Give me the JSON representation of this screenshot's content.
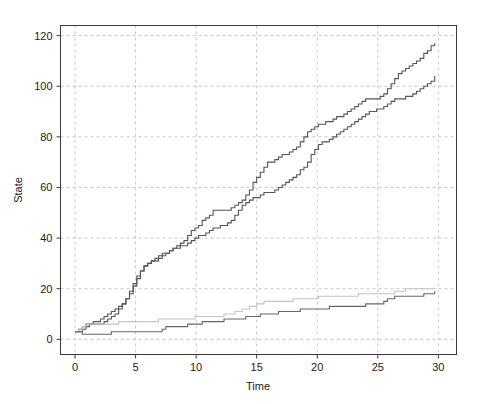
{
  "chart_data": {
    "type": "line",
    "title": "",
    "subtitle": "",
    "xlabel": "Time",
    "ylabel": "State",
    "xlim": [
      -1.2,
      31.5
    ],
    "ylim": [
      -6,
      124
    ],
    "xticks": [
      0,
      5,
      10,
      15,
      20,
      25,
      30
    ],
    "xticklabels": [
      "0",
      "5",
      "10",
      "15",
      "20",
      "25",
      "30"
    ],
    "yticks": [
      0,
      20,
      40,
      60,
      80,
      100,
      120
    ],
    "yticklabels": [
      "0",
      "20",
      "40",
      "60",
      "80",
      "100",
      "120"
    ],
    "grid": true,
    "grid_style": "dashed",
    "grid_color": "#b8b8b8",
    "legend": "none",
    "step_plot": true,
    "series": [
      {
        "name": "path-1-upper-fast",
        "color": "#555555",
        "linewidth": 1.1,
        "x": [
          0.0,
          0.3,
          0.6,
          0.9,
          1.2,
          1.5,
          1.8,
          2.1,
          2.4,
          2.7,
          3.0,
          3.3,
          3.6,
          3.9,
          4.2,
          4.5,
          4.8,
          5.1,
          5.4,
          5.7,
          6.0,
          6.3,
          6.6,
          6.9,
          7.2,
          7.5,
          7.8,
          8.1,
          8.4,
          8.7,
          9.0,
          9.3,
          9.6,
          9.9,
          10.2,
          10.5,
          10.8,
          11.1,
          11.4,
          11.7,
          12.0,
          12.3,
          12.6,
          12.9,
          13.2,
          13.5,
          13.8,
          14.1,
          14.4,
          14.7,
          15.0,
          15.3,
          15.6,
          15.9,
          16.2,
          16.5,
          16.8,
          17.1,
          17.4,
          17.7,
          18.0,
          18.3,
          18.6,
          18.9,
          19.2,
          19.5,
          19.8,
          20.1,
          20.4,
          20.7,
          21.0,
          21.3,
          21.6,
          21.9,
          22.2,
          22.5,
          22.8,
          23.1,
          23.4,
          23.7,
          24.0,
          24.3,
          24.6,
          24.9,
          25.2,
          25.5,
          25.8,
          26.1,
          26.4,
          26.7,
          27.0,
          27.3,
          27.6,
          27.9,
          28.2,
          28.5,
          28.8,
          29.1,
          29.4,
          29.7
        ],
        "y": [
          3,
          4,
          5,
          6,
          6,
          7,
          7,
          8,
          9,
          10,
          11,
          12,
          13,
          14,
          16,
          18,
          21,
          24,
          27,
          29,
          30,
          31,
          31,
          32,
          33,
          34,
          35,
          36,
          37,
          38,
          39,
          41,
          43,
          44,
          45,
          47,
          48,
          49,
          51,
          51,
          51,
          51,
          51,
          52,
          53,
          54,
          55,
          57,
          59,
          62,
          64,
          66,
          68,
          70,
          70,
          71,
          72,
          73,
          73,
          74,
          75,
          76,
          78,
          80,
          82,
          83,
          84,
          85,
          85,
          86,
          86,
          87,
          88,
          88,
          89,
          90,
          91,
          92,
          93,
          94,
          95,
          95,
          95,
          95,
          96,
          97,
          99,
          101,
          103,
          105,
          106,
          107,
          108,
          109,
          110,
          111,
          113,
          114,
          116,
          117
        ]
      },
      {
        "name": "path-2-upper-fast",
        "color": "#555555",
        "linewidth": 1.1,
        "x": [
          0.0,
          0.3,
          0.6,
          0.9,
          1.2,
          1.5,
          1.8,
          2.1,
          2.4,
          2.7,
          3.0,
          3.3,
          3.6,
          3.9,
          4.2,
          4.5,
          4.8,
          5.1,
          5.4,
          5.7,
          6.0,
          6.3,
          6.6,
          6.9,
          7.2,
          7.5,
          7.8,
          8.1,
          8.4,
          8.7,
          9.0,
          9.3,
          9.6,
          9.9,
          10.2,
          10.5,
          10.8,
          11.1,
          11.4,
          11.7,
          12.0,
          12.3,
          12.6,
          12.9,
          13.2,
          13.5,
          13.8,
          14.1,
          14.4,
          14.7,
          15.0,
          15.3,
          15.6,
          15.9,
          16.2,
          16.5,
          16.8,
          17.1,
          17.4,
          17.7,
          18.0,
          18.3,
          18.6,
          18.9,
          19.2,
          19.5,
          19.8,
          20.1,
          20.4,
          20.7,
          21.0,
          21.3,
          21.6,
          21.9,
          22.2,
          22.5,
          22.8,
          23.1,
          23.4,
          23.7,
          24.0,
          24.3,
          24.6,
          24.9,
          25.2,
          25.5,
          25.8,
          26.1,
          26.4,
          26.7,
          27.0,
          27.3,
          27.6,
          27.9,
          28.2,
          28.5,
          28.8,
          29.1,
          29.4,
          29.7
        ],
        "y": [
          3,
          3,
          4,
          5,
          6,
          6,
          6,
          6,
          7,
          8,
          9,
          10,
          12,
          14,
          16,
          19,
          22,
          25,
          27,
          29,
          30,
          31,
          32,
          33,
          34,
          34,
          35,
          36,
          36,
          37,
          37,
          38,
          39,
          40,
          41,
          41,
          42,
          43,
          44,
          44,
          45,
          45,
          46,
          47,
          49,
          51,
          53,
          54,
          55,
          56,
          56,
          57,
          58,
          58,
          58,
          59,
          60,
          61,
          62,
          63,
          64,
          65,
          67,
          68,
          70,
          73,
          75,
          77,
          78,
          78,
          79,
          80,
          81,
          82,
          83,
          84,
          85,
          86,
          87,
          88,
          89,
          90,
          90,
          91,
          91,
          92,
          93,
          94,
          95,
          95,
          95,
          96,
          96,
          97,
          98,
          99,
          100,
          101,
          102,
          104
        ]
      },
      {
        "name": "path-3-lower-light",
        "color": "#c4c4c4",
        "linewidth": 1.1,
        "x": [
          0.0,
          0.3,
          0.6,
          0.9,
          1.2,
          1.5,
          1.8,
          2.1,
          2.4,
          2.7,
          3.0,
          3.3,
          3.6,
          3.9,
          4.2,
          4.5,
          4.8,
          5.1,
          5.4,
          5.7,
          6.0,
          6.3,
          6.6,
          6.9,
          7.2,
          7.5,
          7.8,
          8.1,
          8.4,
          8.7,
          9.0,
          9.3,
          9.6,
          9.9,
          10.2,
          10.5,
          10.8,
          11.1,
          11.4,
          11.7,
          12.0,
          12.3,
          12.6,
          12.9,
          13.2,
          13.5,
          13.8,
          14.1,
          14.4,
          14.7,
          15.0,
          15.3,
          15.6,
          15.9,
          16.2,
          16.5,
          16.8,
          17.1,
          17.4,
          17.7,
          18.0,
          18.3,
          18.6,
          18.9,
          19.2,
          19.5,
          19.8,
          20.1,
          20.4,
          20.7,
          21.0,
          21.3,
          21.6,
          21.9,
          22.2,
          22.5,
          22.8,
          23.1,
          23.4,
          23.7,
          24.0,
          24.3,
          24.6,
          24.9,
          25.2,
          25.5,
          25.8,
          26.1,
          26.4,
          26.7,
          27.0,
          27.3,
          27.6,
          27.9,
          28.2,
          28.5,
          28.8,
          29.1,
          29.4,
          29.7
        ],
        "y": [
          3,
          4,
          5,
          6,
          6,
          6,
          6,
          6,
          6,
          6,
          6,
          6,
          7,
          7,
          7,
          7,
          7,
          7,
          7,
          7,
          7,
          7,
          7,
          8,
          8,
          8,
          8,
          8,
          8,
          8,
          8,
          8,
          8,
          9,
          9,
          9,
          9,
          9,
          9,
          9,
          9,
          10,
          10,
          10,
          11,
          11,
          12,
          12,
          13,
          13,
          14,
          14,
          15,
          15,
          15,
          15,
          15,
          15,
          15,
          15,
          16,
          16,
          16,
          16,
          16,
          16,
          16,
          17,
          17,
          17,
          17,
          17,
          17,
          17,
          17,
          17,
          17,
          17,
          18,
          18,
          18,
          18,
          18,
          18,
          18,
          18,
          18,
          18,
          19,
          19,
          19,
          20,
          20,
          20,
          20,
          20,
          20,
          20,
          20,
          20
        ]
      },
      {
        "name": "path-4-lower-dark",
        "color": "#666666",
        "linewidth": 1.1,
        "x": [
          0.0,
          0.3,
          0.6,
          0.9,
          1.2,
          1.5,
          1.8,
          2.1,
          2.4,
          2.7,
          3.0,
          3.3,
          3.6,
          3.9,
          4.2,
          4.5,
          4.8,
          5.1,
          5.4,
          5.7,
          6.0,
          6.3,
          6.6,
          6.9,
          7.2,
          7.5,
          7.8,
          8.1,
          8.4,
          8.7,
          9.0,
          9.3,
          9.6,
          9.9,
          10.2,
          10.5,
          10.8,
          11.1,
          11.4,
          11.7,
          12.0,
          12.3,
          12.6,
          12.9,
          13.2,
          13.5,
          13.8,
          14.1,
          14.4,
          14.7,
          15.0,
          15.3,
          15.6,
          15.9,
          16.2,
          16.5,
          16.8,
          17.1,
          17.4,
          17.7,
          18.0,
          18.3,
          18.6,
          18.9,
          19.2,
          19.5,
          19.8,
          20.1,
          20.4,
          20.7,
          21.0,
          21.3,
          21.6,
          21.9,
          22.2,
          22.5,
          22.8,
          23.1,
          23.4,
          23.7,
          24.0,
          24.3,
          24.6,
          24.9,
          25.2,
          25.5,
          25.8,
          26.1,
          26.4,
          26.7,
          27.0,
          27.3,
          27.6,
          27.9,
          28.2,
          28.5,
          28.8,
          29.1,
          29.4,
          29.7
        ],
        "y": [
          3,
          3,
          2,
          2,
          2,
          2,
          2,
          2,
          2,
          2,
          3,
          3,
          3,
          3,
          3,
          3,
          3,
          3,
          3,
          3,
          3,
          3,
          3,
          3,
          4,
          5,
          5,
          5,
          5,
          5,
          5,
          6,
          6,
          6,
          6,
          7,
          7,
          7,
          7,
          7,
          7,
          8,
          8,
          8,
          8,
          8,
          8,
          9,
          9,
          9,
          9,
          10,
          10,
          10,
          10,
          10,
          11,
          11,
          11,
          11,
          11,
          11,
          12,
          12,
          12,
          12,
          12,
          12,
          12,
          12,
          13,
          13,
          13,
          13,
          13,
          13,
          13,
          13,
          13,
          13,
          14,
          14,
          14,
          14,
          14,
          15,
          16,
          16,
          17,
          17,
          17,
          17,
          17,
          17,
          17,
          17,
          18,
          18,
          18,
          19
        ]
      }
    ]
  }
}
